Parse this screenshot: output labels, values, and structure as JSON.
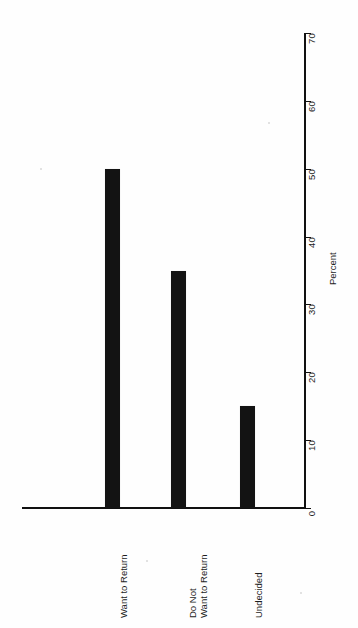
{
  "chart_data": {
    "type": "bar",
    "title": "",
    "subtitle": "",
    "orientation": "page-rotated-90",
    "categories": [
      "Want to Return",
      "Do Not Want to Return",
      "Undecided"
    ],
    "category_label_lines": [
      [
        "Want to Return"
      ],
      [
        "Do Not",
        "Want to Return"
      ],
      [
        "Undecided"
      ]
    ],
    "values": [
      50,
      35,
      15
    ],
    "xlabel": "",
    "ylabel": "Percent",
    "ylim": [
      0,
      70
    ],
    "ytick_labels": [
      "0",
      "10",
      "20",
      "30",
      "40",
      "50",
      "60",
      "70"
    ],
    "ytick_values": [
      0,
      10,
      20,
      30,
      40,
      50,
      60,
      70
    ],
    "grid": false,
    "legend": null,
    "bar_color": "#131313",
    "axis_color": "#111111",
    "background_color": "#ffffff"
  },
  "axis": {
    "value_axis_title": "Percent"
  }
}
